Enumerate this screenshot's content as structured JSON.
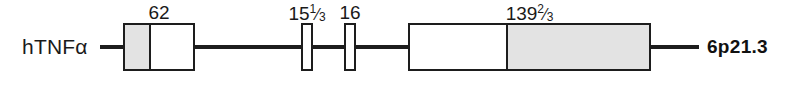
{
  "diagram": {
    "gene_label": "hTNFα",
    "locus_label": "6p21.3",
    "colors": {
      "line": "#1d1d1d",
      "box_border": "#1d1d1d",
      "segment_white": "#ffffff",
      "segment_gray": "#e3e3e3",
      "text": "#1a1a1a",
      "background": "#ffffff"
    },
    "exons": [
      {
        "id": "exon-1",
        "size_label": "62",
        "size_value": 62,
        "x": 123,
        "width": 72,
        "segments": [
          {
            "fill": "gray",
            "width": 27
          },
          {
            "fill": "white",
            "width": 45
          }
        ]
      },
      {
        "id": "exon-2",
        "size_label": "15¹⁄₃",
        "size_value": 15.333,
        "size_whole": "15",
        "size_numerator": "1",
        "size_denominator": "3",
        "x": 301,
        "width": 12,
        "segments": [
          {
            "fill": "white",
            "width": 12
          }
        ]
      },
      {
        "id": "exon-3",
        "size_label": "16",
        "size_value": 16,
        "x": 344,
        "width": 12,
        "segments": [
          {
            "fill": "white",
            "width": 12
          }
        ]
      },
      {
        "id": "exon-4",
        "size_label": "139²⁄₃",
        "size_value": 139.667,
        "size_whole": "139",
        "size_numerator": "2",
        "size_denominator": "3",
        "x": 408,
        "width": 243,
        "segments": [
          {
            "fill": "white",
            "width": 100
          },
          {
            "fill": "gray",
            "width": 143
          }
        ]
      }
    ],
    "introns": [
      {
        "id": "intron-lead",
        "x": 100,
        "width": 25
      },
      {
        "id": "intron-1",
        "x": 193,
        "width": 110
      },
      {
        "id": "intron-2",
        "x": 311,
        "width": 35
      },
      {
        "id": "intron-3",
        "x": 354,
        "width": 56
      },
      {
        "id": "intron-trail",
        "x": 649,
        "width": 50
      }
    ]
  }
}
